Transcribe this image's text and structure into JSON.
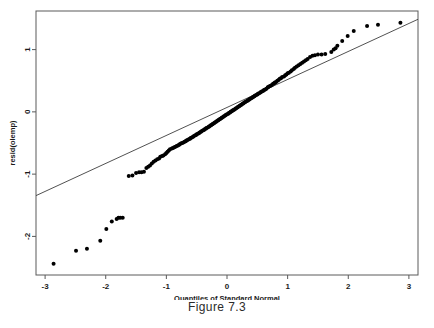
{
  "caption": "Figure 7.3",
  "chart_data": {
    "type": "scatter",
    "title": "",
    "subtitle": "",
    "xlabel": "Quantiles of Standard Normal",
    "ylabel": "resid(olemp)",
    "xlim": [
      -3.15,
      3.15
    ],
    "ylim": [
      -2.62,
      1.62
    ],
    "xticks": [
      -3,
      -2,
      -1,
      0,
      1,
      2,
      3
    ],
    "xticklabels": [
      "-3",
      "-2",
      "-1",
      "0",
      "1",
      "2",
      "3"
    ],
    "yticks": [
      1,
      0,
      -1,
      -2
    ],
    "yticklabels": [
      "1",
      "0",
      "-1",
      "-2"
    ],
    "grid": false,
    "legend": null,
    "point_color": "#000000",
    "point_size": 2.0,
    "line_color": "#3d3d3d",
    "reference_line": {
      "name": "qq-reference-line",
      "x": [
        -3.15,
        3.15
      ],
      "y": [
        -1.345,
        1.487
      ]
    },
    "series": [
      {
        "name": "residual-quantiles",
        "x": [
          -2.86,
          -2.49,
          -2.31,
          -2.09,
          -1.99,
          -1.9,
          -1.82,
          -1.79,
          -1.76,
          -1.72,
          -1.62,
          -1.56,
          -1.5,
          -1.45,
          -1.41,
          -1.37,
          -1.33,
          -1.3,
          -1.27,
          -1.24,
          -1.21,
          -1.18,
          -1.15,
          -1.12,
          -1.1,
          -1.07,
          -1.05,
          -1.02,
          -1.0,
          -0.98,
          -0.96,
          -0.94,
          -0.91,
          -0.89,
          -0.87,
          -0.85,
          -0.83,
          -0.81,
          -0.79,
          -0.78,
          -0.76,
          -0.74,
          -0.72,
          -0.7,
          -0.68,
          -0.67,
          -0.65,
          -0.63,
          -0.61,
          -0.6,
          -0.58,
          -0.56,
          -0.55,
          -0.53,
          -0.51,
          -0.5,
          -0.48,
          -0.46,
          -0.45,
          -0.43,
          -0.42,
          -0.4,
          -0.38,
          -0.37,
          -0.35,
          -0.34,
          -0.32,
          -0.3,
          -0.29,
          -0.27,
          -0.26,
          -0.24,
          -0.23,
          -0.21,
          -0.2,
          -0.18,
          -0.17,
          -0.15,
          -0.14,
          -0.12,
          -0.11,
          -0.09,
          -0.08,
          -0.06,
          -0.05,
          -0.03,
          -0.02,
          0.0,
          0.02,
          0.03,
          0.05,
          0.06,
          0.08,
          0.09,
          0.11,
          0.12,
          0.14,
          0.15,
          0.17,
          0.18,
          0.2,
          0.21,
          0.23,
          0.24,
          0.26,
          0.27,
          0.29,
          0.3,
          0.32,
          0.34,
          0.35,
          0.37,
          0.38,
          0.4,
          0.42,
          0.43,
          0.45,
          0.46,
          0.48,
          0.5,
          0.51,
          0.53,
          0.55,
          0.56,
          0.58,
          0.6,
          0.61,
          0.63,
          0.65,
          0.67,
          0.68,
          0.7,
          0.72,
          0.74,
          0.76,
          0.78,
          0.79,
          0.81,
          0.83,
          0.85,
          0.87,
          0.89,
          0.91,
          0.94,
          0.96,
          0.98,
          1.0,
          1.02,
          1.05,
          1.07,
          1.1,
          1.12,
          1.15,
          1.18,
          1.21,
          1.24,
          1.27,
          1.3,
          1.33,
          1.37,
          1.41,
          1.45,
          1.5,
          1.56,
          1.62,
          1.72,
          1.76,
          1.79,
          1.82,
          1.9,
          1.99,
          2.09,
          2.31,
          2.49,
          2.86
        ],
        "y": [
          -2.44,
          -2.23,
          -2.2,
          -2.07,
          -1.88,
          -1.76,
          -1.72,
          -1.7,
          -1.7,
          -1.7,
          -1.03,
          -1.02,
          -0.98,
          -0.97,
          -0.97,
          -0.96,
          -0.9,
          -0.88,
          -0.86,
          -0.83,
          -0.8,
          -0.78,
          -0.76,
          -0.75,
          -0.72,
          -0.71,
          -0.7,
          -0.68,
          -0.66,
          -0.64,
          -0.62,
          -0.6,
          -0.59,
          -0.58,
          -0.57,
          -0.56,
          -0.55,
          -0.54,
          -0.53,
          -0.52,
          -0.51,
          -0.5,
          -0.49,
          -0.48,
          -0.47,
          -0.46,
          -0.45,
          -0.44,
          -0.43,
          -0.42,
          -0.41,
          -0.4,
          -0.39,
          -0.38,
          -0.37,
          -0.36,
          -0.35,
          -0.34,
          -0.33,
          -0.32,
          -0.31,
          -0.3,
          -0.29,
          -0.28,
          -0.27,
          -0.26,
          -0.25,
          -0.24,
          -0.23,
          -0.22,
          -0.21,
          -0.2,
          -0.19,
          -0.18,
          -0.17,
          -0.16,
          -0.15,
          -0.14,
          -0.13,
          -0.12,
          -0.11,
          -0.1,
          -0.09,
          -0.08,
          -0.07,
          -0.06,
          -0.05,
          -0.04,
          -0.03,
          -0.02,
          -0.01,
          0.0,
          0.01,
          0.02,
          0.03,
          0.04,
          0.05,
          0.06,
          0.07,
          0.08,
          0.09,
          0.1,
          0.11,
          0.12,
          0.13,
          0.14,
          0.15,
          0.16,
          0.17,
          0.18,
          0.19,
          0.2,
          0.21,
          0.22,
          0.23,
          0.24,
          0.25,
          0.26,
          0.27,
          0.28,
          0.29,
          0.3,
          0.31,
          0.32,
          0.33,
          0.34,
          0.35,
          0.36,
          0.37,
          0.39,
          0.4,
          0.41,
          0.42,
          0.43,
          0.45,
          0.46,
          0.47,
          0.48,
          0.5,
          0.51,
          0.53,
          0.54,
          0.56,
          0.57,
          0.59,
          0.6,
          0.62,
          0.63,
          0.65,
          0.67,
          0.69,
          0.71,
          0.73,
          0.75,
          0.77,
          0.79,
          0.81,
          0.83,
          0.85,
          0.88,
          0.9,
          0.91,
          0.92,
          0.92,
          0.93,
          0.96,
          1.0,
          1.02,
          1.06,
          1.14,
          1.22,
          1.3,
          1.38,
          1.4,
          1.43
        ]
      }
    ]
  }
}
